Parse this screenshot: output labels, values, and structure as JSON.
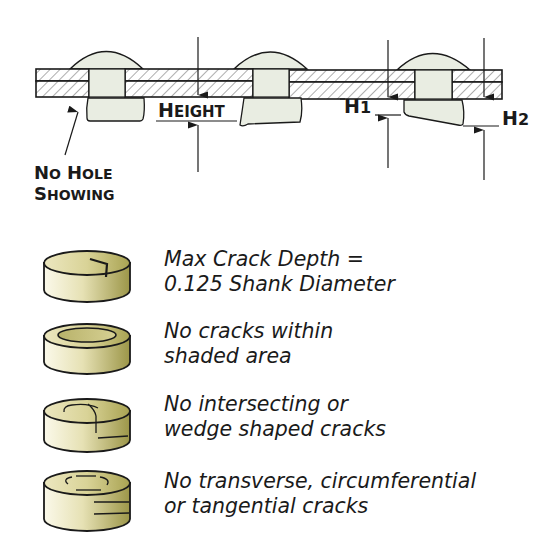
{
  "top_figure": {
    "labels": {
      "no_hole_line1_big": "N",
      "no_hole_line1_small": "O",
      "no_hole_line1b_big": "H",
      "no_hole_line1b_small": "OLE",
      "no_hole_line2_big": "S",
      "no_hole_line2_small": "HOWING",
      "height_big": "H",
      "height_small": "EIGHT",
      "h1_main": "H",
      "h1_sub": "1",
      "h2_main": "H",
      "h2_sub": "2"
    },
    "colors": {
      "rivet_fill": "#e8ece0",
      "hatch": "#555555",
      "stroke": "#1a1a1a"
    }
  },
  "criteria": [
    {
      "id": "max-crack-depth",
      "line1": "Max Crack Depth =",
      "line2": "0.125 Shank Diameter",
      "icon": "rivet-tail-radial-crack-icon"
    },
    {
      "id": "no-cracks-shaded",
      "line1": "No cracks within",
      "line2": "shaded area",
      "icon": "rivet-tail-shaded-ring-icon"
    },
    {
      "id": "no-intersecting",
      "line1": "No intersecting or",
      "line2": "wedge shaped cracks",
      "icon": "rivet-tail-intersecting-crack-icon"
    },
    {
      "id": "no-transverse",
      "line1": "No transverse, circumferential",
      "line2": "or tangential cracks",
      "icon": "rivet-tail-circumferential-crack-icon"
    }
  ],
  "colors": {
    "tail_light": "#f4f1dc",
    "tail_dark": "#a39d4e",
    "tail_top": "#c8c27c",
    "text": "#1a1a1a"
  }
}
